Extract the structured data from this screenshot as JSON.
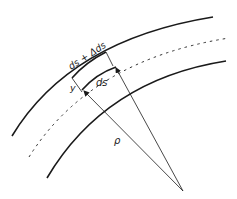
{
  "diagram": {
    "labels": {
      "outer_segment": "ds + Δds",
      "inner_segment": "ds",
      "offset": "y",
      "radius": "ρ"
    },
    "colors": {
      "stroke": "#1a1a1a",
      "background": "#ffffff"
    },
    "elements": [
      "outer-fiber-curve",
      "neutral-axis-dashed-curve",
      "inner-fiber-curve",
      "radius-line-left",
      "radius-line-right",
      "center-of-curvature"
    ]
  }
}
